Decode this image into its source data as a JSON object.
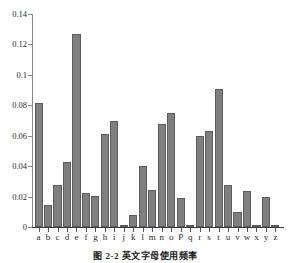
{
  "caption": "图 2-2  英文字母使用频率",
  "colors": {
    "bar_fill": "#7f7f7f",
    "bar_stroke": "#5c5c5c",
    "axis": "#888888",
    "x_axis": "#3a3a3a",
    "text": "#1f1f1f",
    "background": "#ffffff"
  },
  "chart_data": {
    "type": "bar",
    "title": "",
    "subtitle": "",
    "xlabel": "",
    "ylabel": "",
    "ylim": [
      0,
      0.14
    ],
    "grid": false,
    "legend": null,
    "ytick_labels": [
      "0",
      "0.02",
      "0.04",
      "0.06",
      "0.08",
      "0.1",
      "0.12",
      "0.14"
    ],
    "ytick_values": [
      0,
      0.02,
      0.04,
      0.06,
      0.08,
      0.1,
      0.12,
      0.14
    ],
    "categories": [
      "a",
      "b",
      "c",
      "d",
      "e",
      "f",
      "g",
      "h",
      "i",
      "j",
      "k",
      "l",
      "m",
      "n",
      "o",
      "P",
      "q",
      "r",
      "s",
      "t",
      "u",
      "v",
      "w",
      "x",
      "y",
      "z"
    ],
    "values": [
      0.0815,
      0.0145,
      0.0276,
      0.0427,
      0.127,
      0.0223,
      0.0201,
      0.061,
      0.0697,
      0.0015,
      0.0077,
      0.0403,
      0.0241,
      0.0675,
      0.0751,
      0.0193,
      0.001,
      0.0599,
      0.0633,
      0.0906,
      0.0276,
      0.0098,
      0.0236,
      0.0015,
      0.0197,
      0.0007
    ]
  }
}
